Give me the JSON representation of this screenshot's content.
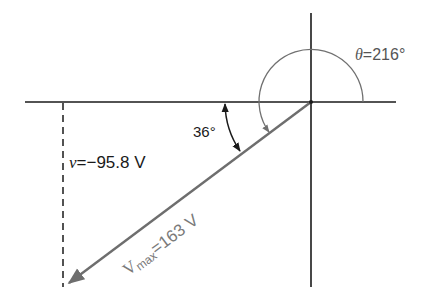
{
  "diagram": {
    "type": "phasor",
    "colors": {
      "axes": "#1a1a1a",
      "phasor": "#6e6e6e",
      "theta_arc": "#707070",
      "angle_arc": "#1a1a1a",
      "projection": "#1a1a1a",
      "theta_label": "#555555",
      "vmax_label": "#7a7a7a",
      "text": "#1a1a1a"
    },
    "labels": {
      "theta": {
        "symbol": "θ",
        "equals": "=",
        "value": "216°"
      },
      "angle": {
        "value": "36°"
      },
      "instantaneous": {
        "symbol": "v",
        "equals": "=",
        "value": "−95.8 V"
      },
      "vmax": {
        "symbol": "V",
        "subscript": "max",
        "equals": "=",
        "value": "163 V"
      }
    },
    "values": {
      "theta_deg": 216,
      "reference_angle_deg": 36,
      "v_instant_volts": -95.8,
      "v_max_volts": 163
    }
  }
}
